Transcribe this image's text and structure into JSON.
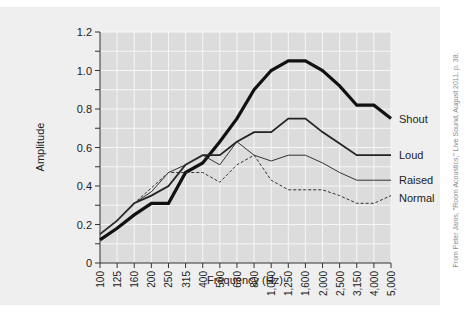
{
  "chart_data": {
    "type": "line",
    "title": "",
    "xlabel": "Frequency (Hz)",
    "ylabel": "Amplitude",
    "ylim": [
      0,
      1.2
    ],
    "yticks": [
      "0",
      "0.2",
      "0.4",
      "0.6",
      "0.8",
      "1.0",
      "1.2"
    ],
    "grid": true,
    "legend_position": "inline-right",
    "categories": [
      "100",
      "125",
      "160",
      "200",
      "250",
      "315",
      "400",
      "500",
      "630",
      "800",
      "1,000",
      "1,250",
      "1,600",
      "2,000",
      "2,500",
      "3,150",
      "4,000",
      "5,000"
    ],
    "series": [
      {
        "name": "Shout",
        "style": "thick-solid",
        "values": [
          0.12,
          0.18,
          0.25,
          0.31,
          0.31,
          0.47,
          0.52,
          0.63,
          0.75,
          0.9,
          1.0,
          1.05,
          1.05,
          1.0,
          0.92,
          0.82,
          0.82,
          0.75
        ]
      },
      {
        "name": "Loud",
        "style": "medium-solid",
        "values": [
          0.15,
          0.22,
          0.31,
          0.35,
          0.4,
          0.51,
          0.56,
          0.56,
          0.63,
          0.68,
          0.68,
          0.75,
          0.75,
          0.68,
          0.62,
          0.56,
          0.56,
          0.56
        ]
      },
      {
        "name": "Raised",
        "style": "thin-solid",
        "values": [
          0.15,
          0.22,
          0.31,
          0.37,
          0.47,
          0.51,
          0.56,
          0.51,
          0.63,
          0.56,
          0.53,
          0.56,
          0.56,
          0.52,
          0.47,
          0.43,
          0.43,
          0.43
        ]
      },
      {
        "name": "Normal",
        "style": "dashed",
        "values": [
          0.15,
          0.22,
          0.31,
          0.39,
          0.47,
          0.47,
          0.47,
          0.42,
          0.51,
          0.56,
          0.43,
          0.38,
          0.38,
          0.38,
          0.35,
          0.31,
          0.31,
          0.35
        ]
      }
    ]
  },
  "credit": "From Peter Janis, \"Room Acoustics,\" Live Sound, August 2011, p. 38."
}
